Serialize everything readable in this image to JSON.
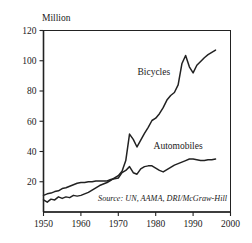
{
  "chart_data": {
    "type": "line",
    "title": "",
    "subtitle": "",
    "xlabel": "",
    "ylabel": "Million",
    "unit_label": "Million",
    "xlim": [
      1950,
      2000
    ],
    "ylim": [
      0,
      120
    ],
    "xticks": [
      1950,
      1960,
      1970,
      1980,
      1990,
      2000
    ],
    "xtick_labels": [
      "1950",
      "1960",
      "1970",
      "1980",
      "1990",
      "2000"
    ],
    "yticks": [
      20,
      40,
      60,
      80,
      100,
      120
    ],
    "ytick_labels": [
      "20",
      "40",
      "60",
      "80",
      "100",
      "120"
    ],
    "grid": false,
    "legend_position": "inline-annotation",
    "annotations": [
      {
        "text": "Bicycles",
        "x": 1979.5,
        "y": 90.5
      },
      {
        "text": "Automobiles",
        "x": 1986.0,
        "y": 42.0
      },
      {
        "text": "Source: UN, AAMA, DRI/McGraw-Hill",
        "x": 1975.0,
        "y": 7.5
      }
    ],
    "source": "Source: UN, AAMA, DRI/McGraw-Hill",
    "x": [
      1950,
      1951,
      1952,
      1953,
      1954,
      1955,
      1956,
      1957,
      1958,
      1959,
      1960,
      1961,
      1962,
      1963,
      1964,
      1965,
      1966,
      1967,
      1968,
      1969,
      1970,
      1971,
      1972,
      1973,
      1974,
      1975,
      1976,
      1977,
      1978,
      1979,
      1980,
      1981,
      1982,
      1983,
      1984,
      1985,
      1986,
      1987,
      1988,
      1989,
      1990,
      1991,
      1992,
      1993,
      1994,
      1995,
      1996
    ],
    "series": [
      {
        "name": "Bicycles",
        "color": "#222222",
        "values": [
          8.0,
          6.5,
          8.5,
          8.0,
          10.0,
          9.0,
          10.0,
          9.5,
          11.0,
          10.5,
          11.0,
          12.0,
          13.0,
          14.5,
          16.0,
          17.5,
          18.5,
          19.5,
          21.0,
          22.5,
          24.0,
          27.0,
          34.0,
          51.5,
          48.0,
          43.0,
          47.5,
          52.0,
          56.0,
          60.5,
          62.0,
          65.0,
          69.0,
          74.0,
          77.0,
          79.0,
          84.0,
          98.0,
          103.5,
          96.0,
          92.0,
          97.0,
          99.5,
          102.0,
          104.0,
          105.5,
          107.0
        ]
      },
      {
        "name": "Automobiles",
        "color": "#222222",
        "values": [
          11.0,
          12.0,
          12.5,
          13.5,
          14.0,
          15.5,
          16.0,
          17.0,
          18.0,
          19.0,
          19.5,
          19.5,
          20.0,
          20.0,
          20.5,
          20.5,
          20.5,
          20.5,
          21.5,
          22.0,
          22.5,
          26.0,
          27.5,
          30.0,
          26.0,
          25.0,
          28.5,
          30.0,
          30.5,
          30.5,
          29.0,
          27.5,
          26.5,
          28.0,
          29.5,
          31.0,
          32.0,
          33.0,
          34.0,
          35.0,
          35.0,
          34.5,
          34.0,
          34.0,
          34.5,
          34.5,
          35.0
        ]
      }
    ]
  },
  "figure": {
    "unit_label": "Million",
    "bicycles_label": "Bicycles",
    "automobiles_label": "Automobiles",
    "source_label": "Source: UN, AAMA, DRI/McGraw-Hill"
  }
}
